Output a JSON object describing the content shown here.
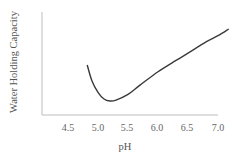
{
  "chart_data": {
    "type": "line",
    "title": "",
    "xlabel": "pH",
    "ylabel": "Water Holding Capacity",
    "x_ticks": [
      "4.5",
      "5.0",
      "5.5",
      "6.0",
      "6.5",
      "7.0"
    ],
    "y_ticks": [],
    "xlim": [
      4.2,
      7.2
    ],
    "ylim": [
      0,
      100
    ],
    "grid": false,
    "legend": null,
    "series": [
      {
        "name": "Water Holding Capacity",
        "x": [
          4.82,
          4.9,
          5.0,
          5.1,
          5.2,
          5.3,
          5.5,
          5.7,
          6.0,
          6.3,
          6.5,
          6.8,
          7.0,
          7.18
        ],
        "values": [
          48.5,
          33,
          22,
          15.5,
          13.6,
          14.5,
          20,
          29,
          42,
          53,
          60,
          71,
          77,
          83.5
        ]
      }
    ]
  }
}
